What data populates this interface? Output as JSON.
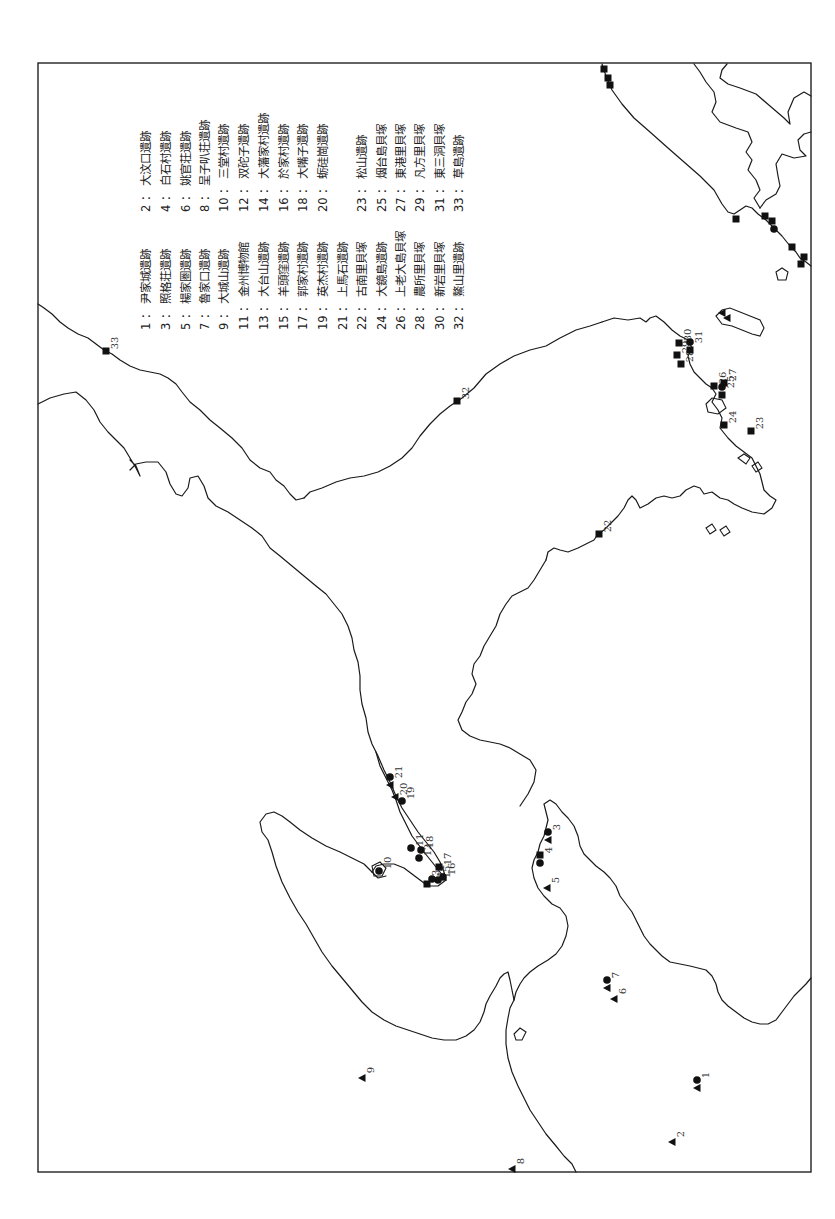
{
  "map": {
    "orientation": "rotated 90° clockwise (page viewed sideways)",
    "frame": {
      "x": 38,
      "y": 62,
      "width": 773,
      "height": 1110
    },
    "marker_types": {
      "square": "filled square",
      "circle": "filled circle",
      "triangle": "filled triangle"
    }
  },
  "legend": {
    "entries": [
      {
        "num": "1",
        "sep": "：",
        "name": "尹家城遺跡"
      },
      {
        "num": "2",
        "sep": "：",
        "name": "大汶口遺跡"
      },
      {
        "num": "3",
        "sep": "：",
        "name": "照格荘遺跡"
      },
      {
        "num": "4",
        "sep": "：",
        "name": "白石村遺跡"
      },
      {
        "num": "5",
        "sep": "：",
        "name": "楊家圏遺跡"
      },
      {
        "num": "6",
        "sep": "：",
        "name": "姚官荘遺跡"
      },
      {
        "num": "7",
        "sep": "：",
        "name": "魯家口遺跡"
      },
      {
        "num": "8",
        "sep": "：",
        "name": "呈子叭荘遺跡"
      },
      {
        "num": "9",
        "sep": "：",
        "name": "大城山遺跡"
      },
      {
        "num": "10",
        "sep": "：",
        "name": "三堂村遺跡"
      },
      {
        "num": "11",
        "sep": "：",
        "name": "金州博物館"
      },
      {
        "num": "12",
        "sep": "：",
        "name": "双砣子遺跡"
      },
      {
        "num": "13",
        "sep": "：",
        "name": "大台山遺跡"
      },
      {
        "num": "14",
        "sep": "：",
        "name": "大藩家村遺跡"
      },
      {
        "num": "15",
        "sep": "：",
        "name": "羊頭窪遺跡"
      },
      {
        "num": "16",
        "sep": "：",
        "name": "於家村遺跡"
      },
      {
        "num": "17",
        "sep": "：",
        "name": "郭家村遺跡"
      },
      {
        "num": "18",
        "sep": "：",
        "name": "大嘴子遺跡"
      },
      {
        "num": "19",
        "sep": "：",
        "name": "英杰村遺跡"
      },
      {
        "num": "20",
        "sep": "：",
        "name": "蛎硅崗遺跡"
      },
      {
        "num": "21",
        "sep": "：",
        "name": "上馬石遺跡"
      },
      {
        "num": "22",
        "sep": "：",
        "name": "古南里貝塚"
      },
      {
        "num": "23",
        "sep": "：",
        "name": "松山遺跡"
      },
      {
        "num": "24",
        "sep": "：",
        "name": "大鏡島遺跡"
      },
      {
        "num": "25",
        "sep": "：",
        "name": "烟台島貝塚"
      },
      {
        "num": "26",
        "sep": "：",
        "name": "上老大島貝塚"
      },
      {
        "num": "27",
        "sep": "：",
        "name": "東港里貝塚"
      },
      {
        "num": "28",
        "sep": "：",
        "name": "農所里貝塚"
      },
      {
        "num": "29",
        "sep": "：",
        "name": "凡方里貝塚"
      },
      {
        "num": "30",
        "sep": "：",
        "name": "新岩里貝塚"
      },
      {
        "num": "31",
        "sep": "：",
        "name": "東三洞貝塚"
      },
      {
        "num": "32",
        "sep": "：",
        "name": "鰲山里遺跡"
      },
      {
        "num": "33",
        "sep": "：",
        "name": "草島遺跡"
      }
    ]
  },
  "sites": [
    {
      "num": "1",
      "markers": [
        "triangle",
        "circle"
      ],
      "x": 697,
      "y": 1083
    },
    {
      "num": "2",
      "markers": [
        "triangle"
      ],
      "x": 672,
      "y": 1142
    },
    {
      "num": "3",
      "markers": [
        "triangle",
        "circle"
      ],
      "x": 548,
      "y": 835
    },
    {
      "num": "4",
      "markers": [
        "circle",
        "square"
      ],
      "x": 540,
      "y": 858
    },
    {
      "num": "5",
      "markers": [
        "triangle"
      ],
      "x": 547,
      "y": 888
    },
    {
      "num": "6",
      "markers": [
        "triangle"
      ],
      "x": 614,
      "y": 999
    },
    {
      "num": "7",
      "markers": [
        "triangle",
        "circle"
      ],
      "x": 607,
      "y": 983
    },
    {
      "num": "8",
      "markers": [
        "triangle"
      ],
      "x": 512,
      "y": 1169
    },
    {
      "num": "9",
      "markers": [
        "triangle"
      ],
      "x": 362,
      "y": 1078
    },
    {
      "num": "10",
      "markers": [
        "circle"
      ],
      "x": 379,
      "y": 871
    },
    {
      "num": "11",
      "markers": [
        "circle"
      ],
      "x": 411,
      "y": 848
    },
    {
      "num": "12",
      "markers": [
        "circle"
      ],
      "x": 419,
      "y": 858
    },
    {
      "num": "13",
      "markers": [
        "square"
      ],
      "x": 427,
      "y": 884
    },
    {
      "num": "14",
      "markers": [
        "circle"
      ],
      "x": 432,
      "y": 879
    },
    {
      "num": "15",
      "markers": [
        "circle"
      ],
      "x": 438,
      "y": 880
    },
    {
      "num": "16",
      "markers": [
        "circle"
      ],
      "x": 443,
      "y": 877
    },
    {
      "num": "17",
      "markers": [
        "square"
      ],
      "x": 439,
      "y": 867
    },
    {
      "num": "18",
      "markers": [
        "circle"
      ],
      "x": 421,
      "y": 850
    },
    {
      "num": "19",
      "markers": [
        "circle"
      ],
      "x": 402,
      "y": 801
    },
    {
      "num": "20",
      "markers": [
        "triangle"
      ],
      "x": 395,
      "y": 797
    },
    {
      "num": "21",
      "markers": [
        "triangle",
        "circle"
      ],
      "x": 390,
      "y": 780
    },
    {
      "num": "22",
      "markers": [
        "square"
      ],
      "x": 599,
      "y": 534
    },
    {
      "num": "23",
      "markers": [
        "square"
      ],
      "x": 751,
      "y": 431
    },
    {
      "num": "24",
      "markers": [
        "square"
      ],
      "x": 724,
      "y": 425
    },
    {
      "num": "25",
      "markers": [
        "square",
        "circle"
      ],
      "x": 722,
      "y": 390
    },
    {
      "num": "26",
      "markers": [
        "square"
      ],
      "x": 714,
      "y": 386
    },
    {
      "num": "27",
      "markers": [
        "square"
      ],
      "x": 724,
      "y": 383
    },
    {
      "num": "28",
      "markers": [
        "square"
      ],
      "x": 681,
      "y": 364
    },
    {
      "num": "29",
      "markers": [
        "square"
      ],
      "x": 677,
      "y": 355
    },
    {
      "num": "30",
      "markers": [
        "square"
      ],
      "x": 679,
      "y": 343
    },
    {
      "num": "31",
      "markers": [
        "square",
        "circle"
      ],
      "x": 690,
      "y": 345
    },
    {
      "num": "32",
      "markers": [
        "square"
      ],
      "x": 457,
      "y": 401
    },
    {
      "num": "33",
      "markers": [
        "square"
      ],
      "x": 106,
      "y": 351
    }
  ],
  "unlabeled_markers": [
    {
      "type": "square",
      "x": 604,
      "y": 69
    },
    {
      "type": "square",
      "x": 608,
      "y": 78
    },
    {
      "type": "square",
      "x": 610,
      "y": 85
    },
    {
      "type": "square",
      "x": 736,
      "y": 219
    },
    {
      "type": "square",
      "x": 765,
      "y": 216
    },
    {
      "type": "square",
      "x": 772,
      "y": 221
    },
    {
      "type": "circle",
      "x": 774,
      "y": 229
    },
    {
      "type": "square",
      "x": 792,
      "y": 247
    },
    {
      "type": "square",
      "x": 804,
      "y": 257
    },
    {
      "type": "square",
      "x": 801,
      "y": 264
    },
    {
      "type": "triangle",
      "x": 722,
      "y": 313
    },
    {
      "type": "triangle",
      "x": 727,
      "y": 318
    }
  ]
}
